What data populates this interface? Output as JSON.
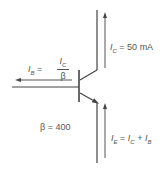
{
  "labels": {
    "ic": {
      "sym": "I",
      "sub": "C",
      "eq": " = 50 mA"
    },
    "ib": {
      "sym": "I",
      "sub": "B",
      "eq": " = ",
      "num_sym": "I",
      "num_sub": "C",
      "den": "β"
    },
    "beta": "β = 400",
    "ie": {
      "sym": "I",
      "sub": "E",
      "eq1": " = ",
      "sym2": "I",
      "sub2": "C",
      "plus": " + ",
      "sym3": "I",
      "sub3": "B"
    }
  },
  "colors": {
    "line": "#444444",
    "text": "#555555"
  }
}
